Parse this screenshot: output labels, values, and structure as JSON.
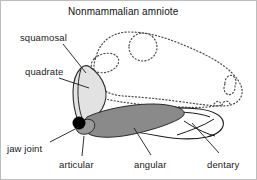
{
  "figure": {
    "title": "Nonmammalian amniote",
    "background_color": "#ffffff",
    "border_color": "#bdbdbd"
  },
  "colors": {
    "outline": "#1a1a1a",
    "skull_dashed_outline": "#4a4a4a",
    "quadrate_fill": "#e2e2e2",
    "angular_fill": "#8a8a8a",
    "articular_fill": "#9a9a9a",
    "dentary_fill": "#ffffff",
    "jaw_joint_dot": "#000000",
    "leader_line": "#1a1a1a",
    "text": "#1a1a1a"
  },
  "labels": [
    {
      "id": "squamosal",
      "text": "squamosal",
      "x": 19,
      "y": 32,
      "leader": {
        "x1": 62,
        "y1": 43,
        "x2": 85,
        "y2": 72
      }
    },
    {
      "id": "quadrate",
      "text": "quadrate",
      "x": 24,
      "y": 66,
      "leader": {
        "x1": 58,
        "y1": 77,
        "x2": 88,
        "y2": 87
      }
    },
    {
      "id": "jaw-joint",
      "text": "jaw joint",
      "x": 6,
      "y": 143,
      "leader": {
        "x1": 49,
        "y1": 141,
        "x2": 78,
        "y2": 126
      }
    },
    {
      "id": "articular",
      "text": "articular",
      "x": 58,
      "y": 159,
      "leader": {
        "x1": 81,
        "y1": 155,
        "x2": 83,
        "y2": 135
      }
    },
    {
      "id": "angular",
      "text": "angular",
      "x": 133,
      "y": 159,
      "leader": {
        "x1": 150,
        "y1": 154,
        "x2": 133,
        "y2": 127
      }
    },
    {
      "id": "dentary",
      "text": "dentary",
      "x": 206,
      "y": 159,
      "leader": {
        "x1": 218,
        "y1": 152,
        "x2": 191,
        "y2": 122
      }
    }
  ],
  "anatomy": {
    "skull_outline_style": "dotted",
    "parts": [
      {
        "id": "skull",
        "name": "skull outline",
        "style": "dotted",
        "fill": "none"
      },
      {
        "id": "orbit",
        "name": "orbit (eye socket)",
        "style": "dotted",
        "fill": "none"
      },
      {
        "id": "naris",
        "name": "external naris (nostril)",
        "style": "dotted",
        "fill": "none"
      },
      {
        "id": "temporal-fenestra",
        "name": "temporal fenestra",
        "style": "dotted",
        "fill": "none"
      },
      {
        "id": "quadrate",
        "name": "quadrate",
        "style": "solid",
        "fill": "#e2e2e2"
      },
      {
        "id": "articular",
        "name": "articular",
        "style": "solid",
        "fill": "#9a9a9a"
      },
      {
        "id": "angular",
        "name": "angular",
        "style": "solid",
        "fill": "#8a8a8a"
      },
      {
        "id": "dentary",
        "name": "dentary",
        "style": "solid",
        "fill": "#ffffff"
      },
      {
        "id": "jaw-joint",
        "name": "jaw joint",
        "style": "dot",
        "fill": "#000000"
      }
    ]
  }
}
